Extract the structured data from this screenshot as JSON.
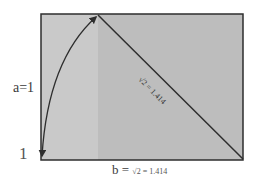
{
  "diagram": {
    "type": "geometric-construction",
    "labels": {
      "side_a": "a=1",
      "unit": "1",
      "side_b_prefix": "b = ",
      "side_b_root": "√2",
      "side_b_value": " = 1.414",
      "diagonal": "√2 = 1.414"
    },
    "colors": {
      "square_fill": "#c9c9c9",
      "extension_fill": "#bdbdbd",
      "stroke": "#2e2e2e",
      "text": "#3a3a3a"
    },
    "geometry": {
      "rect": {
        "x": 41,
        "y": 14,
        "width": 202,
        "height": 146
      },
      "square_right_x": 98,
      "diagonal": {
        "x1": 98,
        "y1": 15,
        "x2": 243,
        "y2": 159
      },
      "arc": {
        "from": [
          41,
          158
        ],
        "to": [
          98,
          15
        ]
      }
    }
  }
}
